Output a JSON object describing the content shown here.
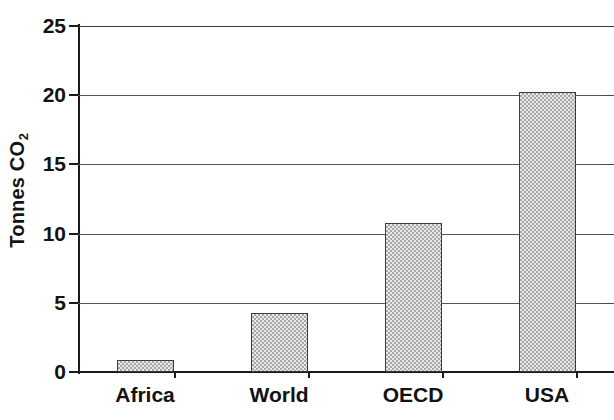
{
  "chart_data": {
    "type": "bar",
    "title": "",
    "xlabel": "",
    "ylabel": "Tonnes CO2",
    "ylabel_base": "Tonnes CO",
    "ylabel_sub": "2",
    "categories": [
      "Africa",
      "World",
      "OECD",
      "USA"
    ],
    "values": [
      0.9,
      4.3,
      10.8,
      20.2
    ],
    "ylim": [
      0,
      25
    ],
    "yticks": [
      0,
      5,
      10,
      15,
      20,
      25
    ],
    "ytick_labels": [
      "0",
      "5",
      "10",
      "15",
      "20",
      "25"
    ],
    "grid": "horizontal",
    "legend": "none",
    "bar_fill": "#c9c9c9",
    "bar_edge": "#3b3b3b",
    "axis_color": "#1a1a1a",
    "grid_color": "#555555",
    "background": "#ffffff"
  }
}
